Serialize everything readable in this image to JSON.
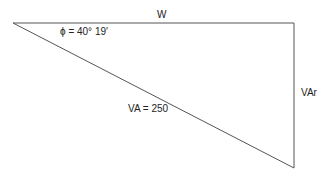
{
  "diagram": {
    "type": "power-triangle",
    "labels": {
      "top_side": "W",
      "angle": "ϕ = 40° 19′",
      "right_side": "VAr",
      "hypotenuse": "VA = 250"
    },
    "colors": {
      "line": "#555555",
      "text": "#222222",
      "background": "#ffffff"
    },
    "vertices": {
      "left": [
        13,
        23
      ],
      "top_right": [
        294,
        23
      ],
      "bottom_right": [
        294,
        168
      ]
    }
  }
}
